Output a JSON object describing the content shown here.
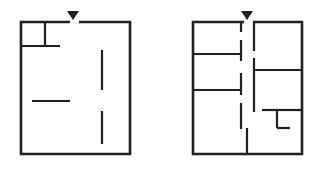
{
  "figure": {
    "title": "",
    "background_color": "#ffffff",
    "wall_color": "#231f20",
    "panel_count": 2
  },
  "panels": [
    {
      "id": "left-floorplan",
      "label": "",
      "bounds": {
        "x": 20,
        "y": 21,
        "width": 111,
        "height": 134
      },
      "entry_marker": {
        "x": 73,
        "y": 11,
        "width": 12,
        "height": 9,
        "shape": "triangle-down"
      },
      "outer_walls": [
        {
          "name": "top-wall-left-segment",
          "x1": 20,
          "y1": 21,
          "x2": 70,
          "y2": 21
        },
        {
          "name": "top-wall-right-segment",
          "x1": 79,
          "y1": 21,
          "x2": 131,
          "y2": 21
        },
        {
          "name": "left-wall",
          "x1": 20,
          "y1": 21,
          "x2": 20,
          "y2": 155
        },
        {
          "name": "right-wall",
          "x1": 131,
          "y1": 21,
          "x2": 131,
          "y2": 155
        },
        {
          "name": "bottom-wall",
          "x1": 20,
          "y1": 155,
          "x2": 131,
          "y2": 155
        }
      ],
      "inner_walls": [
        {
          "name": "closet-vertical-divider",
          "x1": 45,
          "y1": 21,
          "x2": 45,
          "y2": 46
        },
        {
          "name": "closet-horizontal-divider",
          "x1": 20,
          "y1": 46,
          "x2": 60,
          "y2": 46
        },
        {
          "name": "mid-left-horizontal-partition",
          "x1": 32,
          "y1": 101,
          "x2": 70,
          "y2": 101
        },
        {
          "name": "upper-right-vertical-partition",
          "x1": 102,
          "y1": 50,
          "x2": 102,
          "y2": 90
        },
        {
          "name": "lower-right-vertical-partition",
          "x1": 102,
          "y1": 111,
          "x2": 102,
          "y2": 144
        }
      ]
    },
    {
      "id": "right-floorplan",
      "label": "",
      "bounds": {
        "x": 192,
        "y": 21,
        "width": 111,
        "height": 134
      },
      "entry_marker": {
        "x": 247,
        "y": 11,
        "width": 12,
        "height": 9,
        "shape": "triangle-down"
      },
      "outer_walls": [
        {
          "name": "top-wall-left-segment",
          "x1": 192,
          "y1": 21,
          "x2": 244,
          "y2": 21
        },
        {
          "name": "top-wall-right-segment",
          "x1": 253,
          "y1": 21,
          "x2": 303,
          "y2": 21
        },
        {
          "name": "left-wall",
          "x1": 192,
          "y1": 21,
          "x2": 192,
          "y2": 155
        },
        {
          "name": "right-wall",
          "x1": 303,
          "y1": 21,
          "x2": 303,
          "y2": 155
        },
        {
          "name": "bottom-wall",
          "x1": 192,
          "y1": 155,
          "x2": 303,
          "y2": 155
        }
      ],
      "inner_walls": [
        {
          "name": "hall-left-wall-upper",
          "x1": 241,
          "y1": 21,
          "x2": 241,
          "y2": 32
        },
        {
          "name": "hall-left-wall-mid-upper",
          "x1": 241,
          "y1": 40,
          "x2": 241,
          "y2": 61
        },
        {
          "name": "hall-left-wall-mid-lower",
          "x1": 241,
          "y1": 73,
          "x2": 241,
          "y2": 95
        },
        {
          "name": "hall-left-wall-lower",
          "x1": 241,
          "y1": 103,
          "x2": 241,
          "y2": 129
        },
        {
          "name": "hall-right-wall-upper",
          "x1": 254,
          "y1": 21,
          "x2": 254,
          "y2": 51
        },
        {
          "name": "hall-right-wall-mid",
          "x1": 254,
          "y1": 58,
          "x2": 254,
          "y2": 112
        },
        {
          "name": "bedroom-one-divider",
          "x1": 192,
          "y1": 54,
          "x2": 241,
          "y2": 54
        },
        {
          "name": "bedroom-two-divider",
          "x1": 192,
          "y1": 90,
          "x2": 241,
          "y2": 90
        },
        {
          "name": "right-room-divider",
          "x1": 254,
          "y1": 70,
          "x2": 303,
          "y2": 70
        },
        {
          "name": "bath-jog-horizontal-upper",
          "x1": 262,
          "y1": 110,
          "x2": 277,
          "y2": 110
        },
        {
          "name": "bath-jog-vertical",
          "x1": 277,
          "y1": 110,
          "x2": 277,
          "y2": 128
        },
        {
          "name": "bath-jog-horizontal-lower",
          "x1": 277,
          "y1": 128,
          "x2": 290,
          "y2": 128
        },
        {
          "name": "bath-top-horizontal",
          "x1": 277,
          "y1": 110,
          "x2": 303,
          "y2": 110
        },
        {
          "name": "lower-center-vertical-wall",
          "x1": 247,
          "y1": 128,
          "x2": 247,
          "y2": 155
        }
      ]
    }
  ]
}
